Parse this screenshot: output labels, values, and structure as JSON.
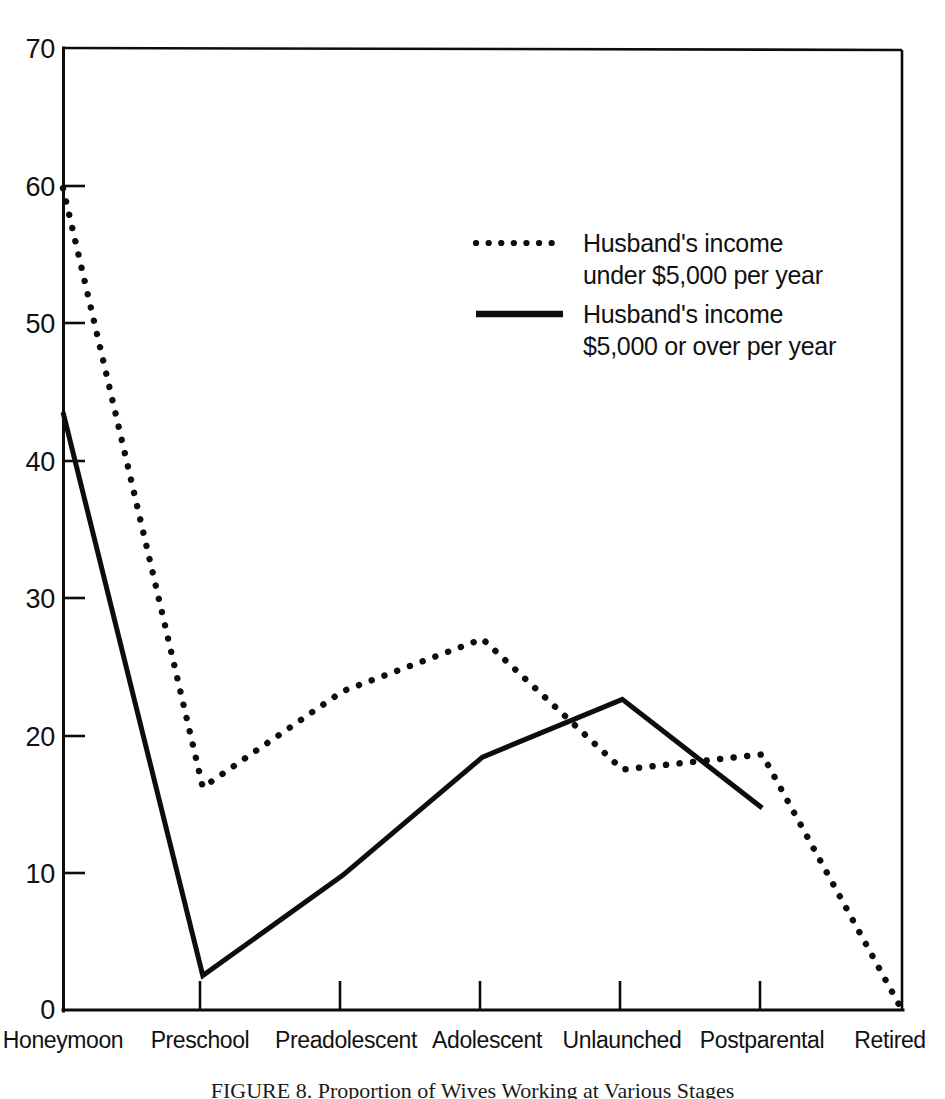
{
  "chart_data": {
    "type": "line",
    "title": "",
    "xlabel": "",
    "ylabel": "",
    "categories": [
      "Honeymoon",
      "Preschool",
      "Preadolescent",
      "Adolescent",
      "Unlaunched",
      "Postparental",
      "Retired"
    ],
    "ylim": [
      0,
      70
    ],
    "xlim": [
      0,
      6
    ],
    "yticks": [
      0,
      10,
      20,
      30,
      40,
      50,
      60,
      70
    ],
    "ytick_labels": [
      "0",
      "10",
      "20",
      "30",
      "40",
      "50",
      "60",
      "70"
    ],
    "grid": false,
    "legend_position": "upper center",
    "series": [
      {
        "name": "Husband's income under $5,000 per year",
        "style": "dotted",
        "color": "#0d0d0d",
        "values": [
          59.8,
          16.2,
          23.2,
          27.0,
          17.5,
          18.6,
          0.0
        ]
      },
      {
        "name": "Husband's income $5,000 or over per year",
        "style": "solid",
        "color": "#0d0d0d",
        "values": [
          43.5,
          2.5,
          9.8,
          18.4,
          22.6,
          14.7,
          null
        ]
      }
    ]
  },
  "legend": {
    "entries": [
      {
        "marker": "dotted",
        "line1": "Husband's income",
        "line2": "under $5,000 per year"
      },
      {
        "marker": "solid",
        "line1": "Husband's income",
        "line2": "$5,000 or over per year"
      }
    ]
  },
  "caption": {
    "text": "FIGURE 8. Proportion of Wives Working at Various Stages"
  }
}
